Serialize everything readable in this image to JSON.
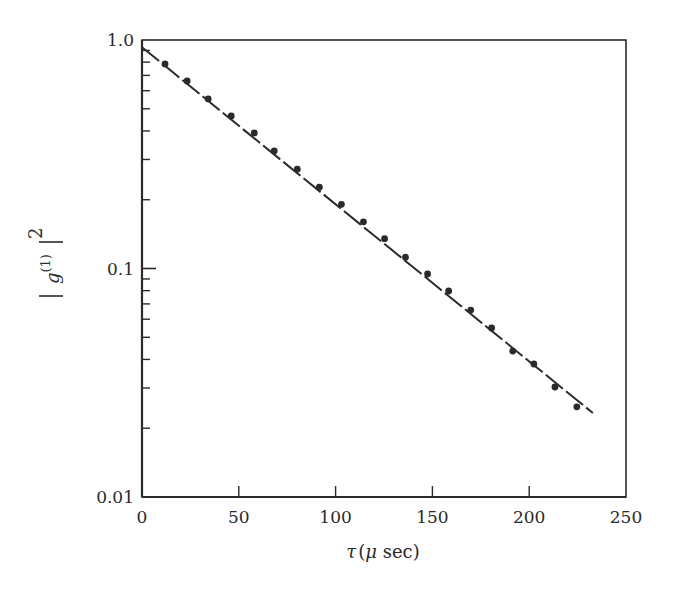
{
  "chart_data": {
    "type": "scatter",
    "title": "",
    "xlabel": "τ (μ sec)",
    "ylabel": "|g(1)|^2",
    "ylabel_parts": {
      "base": "g",
      "superscript": "(1)",
      "power": "2"
    },
    "xlabel_parts": {
      "symbol": "τ",
      "open": "(",
      "mu": "μ",
      "unit": " sec)"
    },
    "xscale": "linear",
    "yscale": "log",
    "xlim": [
      0,
      250
    ],
    "ylim": [
      0.01,
      1.0
    ],
    "x_ticks": [
      0,
      50,
      100,
      150,
      200,
      250
    ],
    "x_tick_labels": [
      "0",
      "50",
      "100",
      "150",
      "200",
      "250"
    ],
    "y_ticks": [
      0.01,
      0.1,
      1.0
    ],
    "y_tick_labels": [
      "0.01",
      "0.1",
      "1.0"
    ],
    "grid": false,
    "legend": null,
    "series": [
      {
        "name": "measured",
        "style": "markers",
        "x": [
          11.9,
          23.3,
          34.2,
          46.1,
          58.0,
          68.3,
          80.2,
          91.6,
          103.0,
          114.4,
          125.3,
          136.1,
          147.5,
          158.4,
          169.8,
          180.6,
          191.5,
          202.4,
          213.3,
          224.6
        ],
        "y": [
          0.785,
          0.662,
          0.552,
          0.465,
          0.392,
          0.327,
          0.272,
          0.227,
          0.191,
          0.16,
          0.135,
          0.112,
          0.0946,
          0.0797,
          0.0658,
          0.0549,
          0.0435,
          0.0382,
          0.0303,
          0.0248
        ]
      },
      {
        "name": "exponential fit",
        "style": "line",
        "x": [
          0,
          232.9
        ],
        "y": [
          0.93,
          0.0233
        ]
      }
    ],
    "colors": {
      "ink": "#2a2a2a",
      "background": "#ffffff"
    }
  }
}
